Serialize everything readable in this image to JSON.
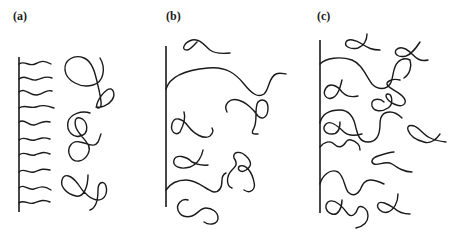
{
  "figure": {
    "stroke_color": "#1a1a1a",
    "background": "#ffffff",
    "panels": [
      {
        "id": "a",
        "label": "(a)"
      },
      {
        "id": "b",
        "label": "(b)"
      },
      {
        "id": "c",
        "label": "(c)"
      }
    ]
  }
}
